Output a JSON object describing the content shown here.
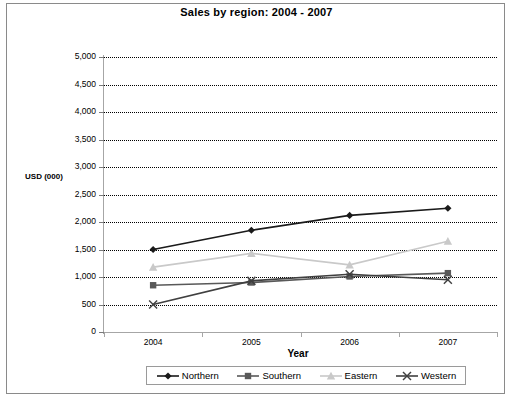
{
  "chart_data": {
    "type": "line",
    "title": "Sales by region: 2004 - 2007",
    "xlabel": "Year",
    "ylabel": "USD (000)",
    "categories": [
      "2004",
      "2005",
      "2006",
      "2007"
    ],
    "ylim": [
      0,
      5000
    ],
    "ytick_step": 500,
    "ytick_labels": [
      "5,000",
      "4,500",
      "4,000",
      "3,500",
      "3,000",
      "2,500",
      "2,000",
      "1,500",
      "1,000",
      "500",
      "0"
    ],
    "ytick_values": [
      5000,
      4500,
      4000,
      3500,
      3000,
      2500,
      2000,
      1500,
      1000,
      500,
      0
    ],
    "grid": true,
    "grid_style": "dotted-horizontal",
    "legend_position": "bottom",
    "series": [
      {
        "name": "Northern",
        "marker": "diamond",
        "color": "#1a1a1a",
        "values": [
          1500,
          1850,
          2120,
          2250
        ]
      },
      {
        "name": "Southern",
        "marker": "square",
        "color": "#595959",
        "values": [
          850,
          900,
          1010,
          1070
        ]
      },
      {
        "name": "Eastern",
        "marker": "triangle",
        "color": "#c9c9c9",
        "values": [
          1180,
          1430,
          1220,
          1650
        ]
      },
      {
        "name": "Western",
        "marker": "x",
        "color": "#404040",
        "values": [
          500,
          930,
          1050,
          950
        ]
      }
    ]
  },
  "legend": {
    "items": [
      {
        "label": "Northern"
      },
      {
        "label": "Southern"
      },
      {
        "label": "Eastern"
      },
      {
        "label": "Western"
      }
    ]
  }
}
